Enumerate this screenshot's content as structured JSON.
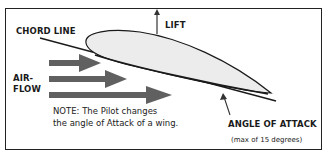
{
  "diagram": {
    "labels": {
      "chord_line": "CHORD LINE",
      "lift": "LIFT",
      "airflow_line1": "AIR-",
      "airflow_line2": "FLOW",
      "angle_of_attack": "ANGLE OF ATTACK",
      "angle_limit": "(max of 15 degrees)"
    },
    "note": {
      "line1": "NOTE: The Pilot changes",
      "line2": "the angle of Attack of a wing."
    },
    "colors": {
      "wing_fill": "#ececec",
      "outline": "#1a1a1a",
      "arrow_fill": "#606060",
      "border": "#222222"
    }
  }
}
